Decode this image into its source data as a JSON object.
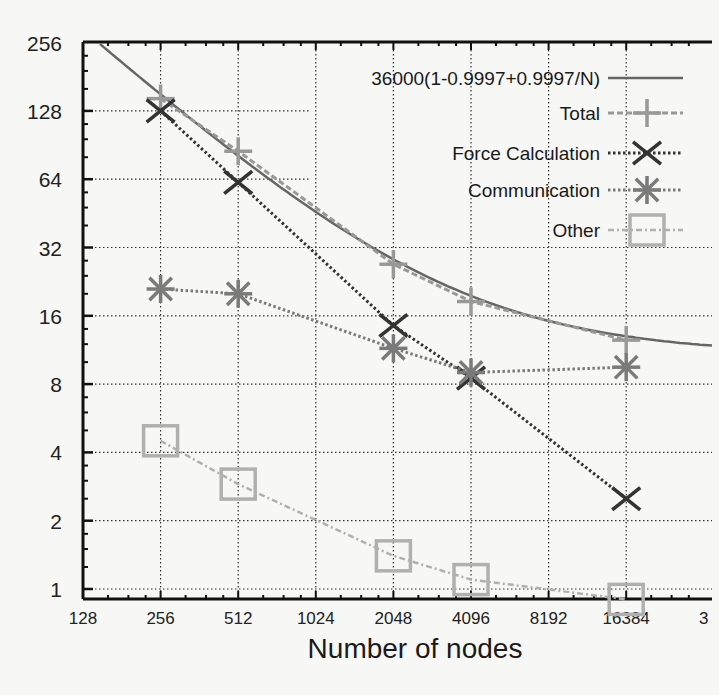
{
  "chart_data": {
    "type": "line",
    "title": "",
    "xlabel": "Number of nodes",
    "ylabel": "",
    "x_scale": "log2",
    "y_scale": "log2",
    "xlim": [
      128,
      32768
    ],
    "ylim": [
      1,
      256
    ],
    "grid": true,
    "legend_position": "top-right",
    "x_ticks": [
      "128",
      "256",
      "512",
      "1024",
      "2048",
      "4096",
      "8192",
      "16384",
      "3"
    ],
    "y_ticks": [
      "1",
      "2",
      "4",
      "8",
      "16",
      "32",
      "64",
      "128",
      "256"
    ],
    "x": [
      256,
      512,
      2048,
      4096,
      16384
    ],
    "series": [
      {
        "name": "36000(1-0.9997+0.9997/N)",
        "style": "solid",
        "color": "#666666",
        "marker": "none",
        "formula": "36000*(1-0.9997+0.9997/N)/N"
      },
      {
        "name": "Total",
        "style": "dashed",
        "color": "#999999",
        "marker": "plus",
        "values": [
          145,
          85,
          27,
          18.5,
          12.5
        ]
      },
      {
        "name": "Force Calculation",
        "style": "dotted",
        "color": "#333333",
        "marker": "x",
        "values": [
          128,
          62,
          14.5,
          8.5,
          2.5
        ]
      },
      {
        "name": "Communication",
        "style": "dotted",
        "color": "#7a7a7a",
        "marker": "asterisk",
        "values": [
          21,
          20,
          11.5,
          9,
          9.5
        ]
      },
      {
        "name": "Other",
        "style": "dash-dot",
        "color": "#b0b0b0",
        "marker": "square",
        "values": [
          4.5,
          2.9,
          1.4,
          1.1,
          0.9
        ]
      }
    ]
  }
}
